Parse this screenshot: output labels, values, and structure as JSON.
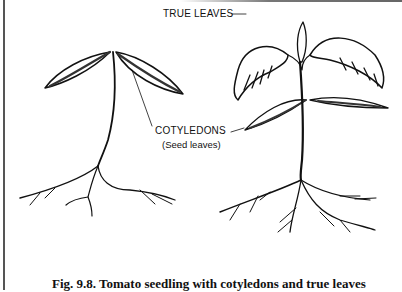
{
  "figure": {
    "labels": {
      "true_leaves": "TRUE LEAVES",
      "cotyledons": "COTYLEDONS",
      "cotyledons_sub": "(Seed leaves)"
    },
    "caption": "Fig. 9.8. Tomato seedling with cotyledons and true leaves",
    "plants": [
      {
        "name": "young-seedling",
        "parts": [
          "cotyledons",
          "stem",
          "roots"
        ]
      },
      {
        "name": "older-seedling",
        "parts": [
          "true-leaves",
          "cotyledons",
          "stem",
          "roots"
        ]
      }
    ]
  }
}
